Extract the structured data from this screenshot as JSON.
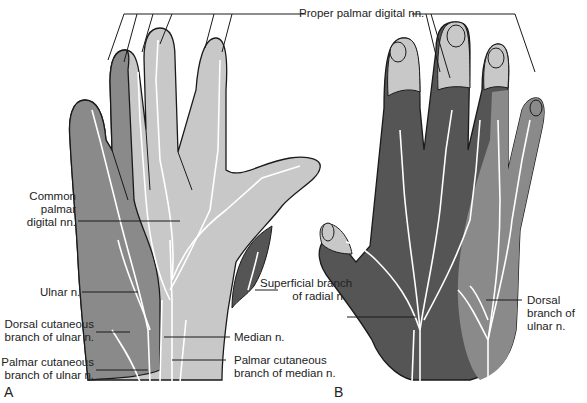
{
  "figure": {
    "colors": {
      "light_gray": "#c8c8c8",
      "medium_gray": "#8a8a8a",
      "dark_gray": "#555555",
      "outline": "#1a1a1a",
      "nerve": "#ffffff",
      "background": "#ffffff"
    },
    "panels": {
      "a": {
        "letter": "A",
        "view": "palmar"
      },
      "b": {
        "letter": "B",
        "view": "dorsal"
      }
    },
    "labels": {
      "proper_palmar_digital": "Proper palmar digital nn.",
      "common_palmar_digital": [
        "Common",
        "palmar",
        "digital nn."
      ],
      "ulnar": "Ulnar n.",
      "dorsal_cutaneous_ulnar": [
        "Dorsal cutaneous",
        "branch of ulnar n."
      ],
      "palmar_cutaneous_ulnar": [
        "Palmar cutaneous",
        "branch of ulnar n."
      ],
      "superficial_radial": [
        "Superficial branch",
        "of radial n."
      ],
      "median": "Median n.",
      "palmar_cutaneous_median": [
        "Palmar cutaneous",
        "branch of median n."
      ],
      "dorsal_branch_ulnar": [
        "Dorsal",
        "branch of",
        "ulnar n."
      ]
    }
  }
}
